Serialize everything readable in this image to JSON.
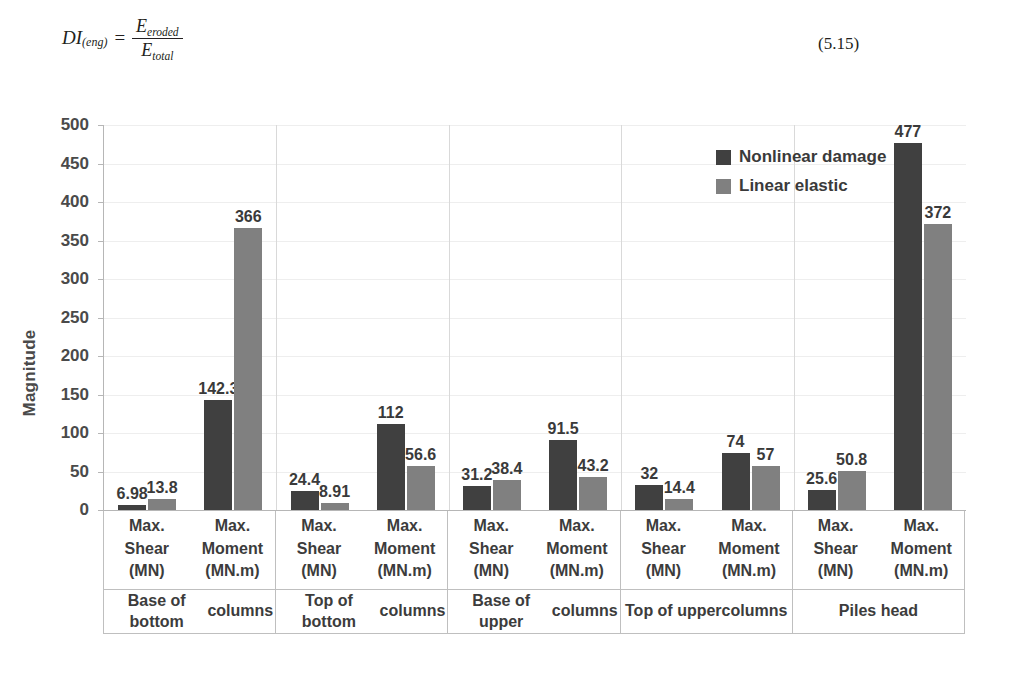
{
  "equation": {
    "lhs_main": "DI",
    "lhs_sub": "(eng)",
    "equals": "=",
    "numerator_var": "E",
    "numerator_sub": "eroded",
    "denominator_var": "E",
    "denominator_sub": "total",
    "number": "(5.15)"
  },
  "chart_data": {
    "type": "bar",
    "title": "",
    "xlabel": "",
    "ylabel": "Magnitude",
    "ylim": [
      0,
      500
    ],
    "ytick_step": 50,
    "yticks": [
      "500",
      "450",
      "400",
      "350",
      "300",
      "250",
      "200",
      "150",
      "100",
      "50",
      "0"
    ],
    "grid": true,
    "legend_position": "top-right",
    "colors": {
      "nonlinear_damage": "#404040",
      "linear_elastic": "#808080"
    },
    "legend": [
      {
        "name": "Nonlinear damage",
        "color": "#404040"
      },
      {
        "name": "Linear elastic",
        "color": "#808080"
      }
    ],
    "series": [
      {
        "name": "Nonlinear damage",
        "values": [
          6.98,
          142.3,
          24.4,
          112,
          31.2,
          91.5,
          32,
          74,
          25.6,
          477
        ],
        "labels": [
          "6.98",
          "142.3",
          "24.4",
          "112",
          "31.2",
          "91.5",
          "32",
          "74",
          "25.6",
          "477"
        ]
      },
      {
        "name": "Linear elastic",
        "values": [
          13.8,
          366,
          8.91,
          56.6,
          38.4,
          43.2,
          14.4,
          57,
          50.8,
          372
        ],
        "labels": [
          "13.8",
          "366",
          "8.91",
          "56.6",
          "38.4",
          "43.2",
          "14.4",
          "57",
          "50.8",
          "372"
        ]
      }
    ],
    "categories": [
      "Max. Shear (MN)",
      "Max. Moment (MN.m)",
      "Max. Shear (MN)",
      "Max. Moment (MN.m)",
      "Max. Shear (MN)",
      "Max. Moment (MN.m)",
      "Max. Shear (MN)",
      "Max. Moment (MN.m)",
      "Max. Shear (MN)",
      "Max. Moment (MN.m)"
    ],
    "groups": [
      {
        "label": "Base of bottom columns",
        "label_lines": [
          "Base of bottom",
          "columns"
        ],
        "subcategories": [
          {
            "lines": [
              "Max.",
              "Shear",
              "(MN)"
            ]
          },
          {
            "lines": [
              "Max.",
              "Moment",
              "(MN.m)"
            ]
          }
        ],
        "points": [
          {
            "nonlinear_damage": 6.98,
            "linear_elastic": 13.8
          },
          {
            "nonlinear_damage": 142.3,
            "linear_elastic": 366
          }
        ]
      },
      {
        "label": "Top of bottom columns",
        "label_lines": [
          "Top of bottom",
          "columns"
        ],
        "subcategories": [
          {
            "lines": [
              "Max.",
              "Shear",
              "(MN)"
            ]
          },
          {
            "lines": [
              "Max.",
              "Moment",
              "(MN.m)"
            ]
          }
        ],
        "points": [
          {
            "nonlinear_damage": 24.4,
            "linear_elastic": 8.91
          },
          {
            "nonlinear_damage": 112,
            "linear_elastic": 56.6
          }
        ]
      },
      {
        "label": "Base of upper columns",
        "label_lines": [
          "Base of upper",
          "columns"
        ],
        "subcategories": [
          {
            "lines": [
              "Max.",
              "Shear",
              "(MN)"
            ]
          },
          {
            "lines": [
              "Max.",
              "Moment",
              "(MN.m)"
            ]
          }
        ],
        "points": [
          {
            "nonlinear_damage": 31.2,
            "linear_elastic": 38.4
          },
          {
            "nonlinear_damage": 91.5,
            "linear_elastic": 43.2
          }
        ]
      },
      {
        "label": "Top of upper columns",
        "label_lines": [
          "Top of upper",
          "columns"
        ],
        "subcategories": [
          {
            "lines": [
              "Max.",
              "Shear",
              "(MN)"
            ]
          },
          {
            "lines": [
              "Max.",
              "Moment",
              "(MN.m)"
            ]
          }
        ],
        "points": [
          {
            "nonlinear_damage": 32,
            "linear_elastic": 14.4
          },
          {
            "nonlinear_damage": 74,
            "linear_elastic": 57
          }
        ]
      },
      {
        "label": "Piles head",
        "label_lines": [
          "Piles head"
        ],
        "subcategories": [
          {
            "lines": [
              "Max.",
              "Shear",
              "(MN)"
            ]
          },
          {
            "lines": [
              "Max.",
              "Moment",
              "(MN.m)"
            ]
          }
        ],
        "points": [
          {
            "nonlinear_damage": 25.6,
            "linear_elastic": 50.8
          },
          {
            "nonlinear_damage": 477,
            "linear_elastic": 372
          }
        ]
      }
    ]
  }
}
